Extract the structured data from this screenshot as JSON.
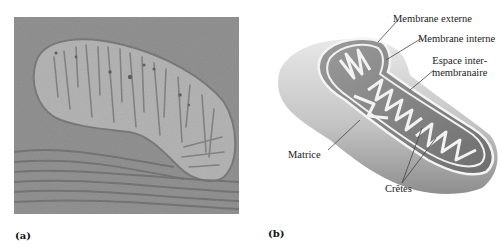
{
  "figure": {
    "panel_a": {
      "label": "(a)",
      "description": "Electron micrograph of a mitochondrion with cristae",
      "colors": {
        "background": "#8a8a8a",
        "matrix": "#d6d6d6",
        "membranes": "#555555"
      }
    },
    "panel_b": {
      "label": "(b)",
      "description": "3D cutaway diagram of a mitochondrion",
      "labels": {
        "outer_membrane": "Membrane externe",
        "inner_membrane": "Membrane interne",
        "intermembrane_space_line1": "Espace inter-",
        "intermembrane_space_line2": "membranaire",
        "matrix": "Matrice",
        "cristae": "Crêtes"
      },
      "colors": {
        "body_light": "#e4e4e4",
        "body_dark": "#9a9a9a",
        "inner": "#7d7d7d",
        "membrane": "#f2f2f2"
      }
    }
  }
}
